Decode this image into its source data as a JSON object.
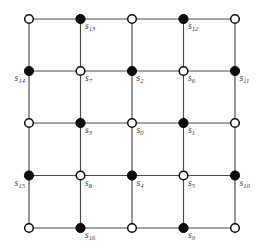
{
  "figure": {
    "width": 264,
    "height": 252,
    "background_color": "#ffffff",
    "edge_color": "#4a4a4a",
    "filled_node_color": "#0a0a0a",
    "hollow_node_fill": "#ffffff",
    "hollow_node_stroke": "#0a0a0a",
    "label_color": "#3d3d3d"
  },
  "grid": {
    "rows": 5,
    "cols": 5,
    "x_positions": [
      29,
      80.5,
      132,
      183.5,
      235
    ],
    "y_positions": [
      19,
      71,
      123,
      175.5,
      228
    ],
    "node_radius_filled": 4.6,
    "node_radius_hollow": 4.3
  },
  "nodes": [
    {
      "id": "r0c0",
      "row": 0,
      "col": 0,
      "x": 29,
      "y": 19,
      "type": "hollow",
      "label": "",
      "sub": "",
      "label_pos": "none"
    },
    {
      "id": "r0c1",
      "row": 0,
      "col": 1,
      "x": 80.5,
      "y": 19,
      "type": "filled",
      "label": "s",
      "sub": "13",
      "label_pos": "br"
    },
    {
      "id": "r0c2",
      "row": 0,
      "col": 2,
      "x": 132,
      "y": 19,
      "type": "hollow",
      "label": "",
      "sub": "",
      "label_pos": "none"
    },
    {
      "id": "r0c3",
      "row": 0,
      "col": 3,
      "x": 183.5,
      "y": 19,
      "type": "filled",
      "label": "s",
      "sub": "12",
      "label_pos": "br"
    },
    {
      "id": "r0c4",
      "row": 0,
      "col": 4,
      "x": 235,
      "y": 19,
      "type": "hollow",
      "label": "",
      "sub": "",
      "label_pos": "none"
    },
    {
      "id": "r1c0",
      "row": 1,
      "col": 0,
      "x": 29,
      "y": 71,
      "type": "filled",
      "label": "s",
      "sub": "14",
      "label_pos": "bl"
    },
    {
      "id": "r1c1",
      "row": 1,
      "col": 1,
      "x": 80.5,
      "y": 71,
      "type": "hollow",
      "label": "s",
      "sub": "7",
      "label_pos": "br"
    },
    {
      "id": "r1c2",
      "row": 1,
      "col": 2,
      "x": 132,
      "y": 71,
      "type": "filled",
      "label": "s",
      "sub": "2",
      "label_pos": "br"
    },
    {
      "id": "r1c3",
      "row": 1,
      "col": 3,
      "x": 183.5,
      "y": 71,
      "type": "hollow",
      "label": "s",
      "sub": "6",
      "label_pos": "br"
    },
    {
      "id": "r1c4",
      "row": 1,
      "col": 4,
      "x": 235,
      "y": 71,
      "type": "filled",
      "label": "s",
      "sub": "11",
      "label_pos": "br"
    },
    {
      "id": "r2c0",
      "row": 2,
      "col": 0,
      "x": 29,
      "y": 123,
      "type": "hollow",
      "label": "",
      "sub": "",
      "label_pos": "none"
    },
    {
      "id": "r2c1",
      "row": 2,
      "col": 1,
      "x": 80.5,
      "y": 123,
      "type": "filled",
      "label": "s",
      "sub": "3",
      "label_pos": "br"
    },
    {
      "id": "r2c2",
      "row": 2,
      "col": 2,
      "x": 132,
      "y": 123,
      "type": "hollow",
      "label": "s",
      "sub": "0",
      "label_pos": "br"
    },
    {
      "id": "r2c3",
      "row": 2,
      "col": 3,
      "x": 183.5,
      "y": 123,
      "type": "filled",
      "label": "s",
      "sub": "1",
      "label_pos": "br"
    },
    {
      "id": "r2c4",
      "row": 2,
      "col": 4,
      "x": 235,
      "y": 123,
      "type": "hollow",
      "label": "",
      "sub": "",
      "label_pos": "none"
    },
    {
      "id": "r3c0",
      "row": 3,
      "col": 0,
      "x": 29,
      "y": 175.5,
      "type": "filled",
      "label": "s",
      "sub": "15",
      "label_pos": "bl"
    },
    {
      "id": "r3c1",
      "row": 3,
      "col": 1,
      "x": 80.5,
      "y": 175.5,
      "type": "hollow",
      "label": "s",
      "sub": "8",
      "label_pos": "br"
    },
    {
      "id": "r3c2",
      "row": 3,
      "col": 2,
      "x": 132,
      "y": 175.5,
      "type": "filled",
      "label": "s",
      "sub": "4",
      "label_pos": "br"
    },
    {
      "id": "r3c3",
      "row": 3,
      "col": 3,
      "x": 183.5,
      "y": 175.5,
      "type": "hollow",
      "label": "s",
      "sub": "5",
      "label_pos": "br"
    },
    {
      "id": "r3c4",
      "row": 3,
      "col": 4,
      "x": 235,
      "y": 175.5,
      "type": "filled",
      "label": "s",
      "sub": "10",
      "label_pos": "br"
    },
    {
      "id": "r4c0",
      "row": 4,
      "col": 0,
      "x": 29,
      "y": 228,
      "type": "hollow",
      "label": "",
      "sub": "",
      "label_pos": "none"
    },
    {
      "id": "r4c1",
      "row": 4,
      "col": 1,
      "x": 80.5,
      "y": 228,
      "type": "filled",
      "label": "s",
      "sub": "16",
      "label_pos": "br"
    },
    {
      "id": "r4c2",
      "row": 4,
      "col": 2,
      "x": 132,
      "y": 228,
      "type": "hollow",
      "label": "",
      "sub": "",
      "label_pos": "none"
    },
    {
      "id": "r4c3",
      "row": 4,
      "col": 3,
      "x": 183.5,
      "y": 228,
      "type": "filled",
      "label": "s",
      "sub": "9",
      "label_pos": "br"
    },
    {
      "id": "r4c4",
      "row": 4,
      "col": 4,
      "x": 235,
      "y": 228,
      "type": "hollow",
      "label": "",
      "sub": "",
      "label_pos": "none"
    }
  ]
}
